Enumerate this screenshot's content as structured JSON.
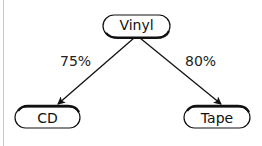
{
  "diagram": {
    "nodes": [
      {
        "id": "vinyl",
        "label": "Vinyl"
      },
      {
        "id": "cd",
        "label": "CD"
      },
      {
        "id": "tape",
        "label": "Tape"
      }
    ],
    "edges": [
      {
        "from": "vinyl",
        "to": "cd",
        "label": "75%"
      },
      {
        "from": "vinyl",
        "to": "tape",
        "label": "80%"
      }
    ],
    "colors": {
      "stroke": "#111111",
      "background": "#ffffff",
      "edge_line": "#c8c8c8"
    }
  }
}
